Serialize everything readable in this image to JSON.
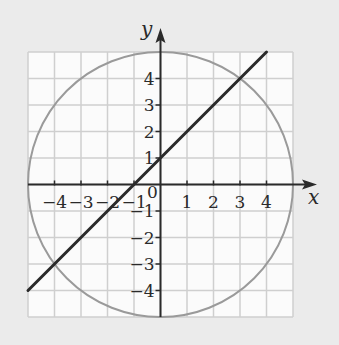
{
  "figure": {
    "background_color": "#ebebeb",
    "grid_background_color": "#fbfbfb",
    "grid_line_color": "#cfcfcf",
    "axis_color": "#2a2a2a",
    "circle_color": "#9a9a9a",
    "line_color": "#2a2a2a"
  },
  "axes": {
    "x_label": "x",
    "y_label": "y",
    "origin_label": "0",
    "grid_range": [
      -5,
      5
    ],
    "x_ticks": [
      {
        "value": -4,
        "label": "−4"
      },
      {
        "value": -3,
        "label": "−3"
      },
      {
        "value": -2,
        "label": "−2"
      },
      {
        "value": -1,
        "label": "−1"
      },
      {
        "value": 1,
        "label": "1"
      },
      {
        "value": 2,
        "label": "2"
      },
      {
        "value": 3,
        "label": "3"
      },
      {
        "value": 4,
        "label": "4"
      }
    ],
    "y_ticks": [
      {
        "value": 4,
        "label": "4"
      },
      {
        "value": 3,
        "label": "3"
      },
      {
        "value": 2,
        "label": "2"
      },
      {
        "value": 1,
        "label": "1"
      },
      {
        "value": -1,
        "label": "−1"
      },
      {
        "value": -2,
        "label": "−2"
      },
      {
        "value": -3,
        "label": "−3"
      },
      {
        "value": -4,
        "label": "−4"
      }
    ]
  },
  "curves": {
    "circle": {
      "center": [
        0,
        0
      ],
      "radius": 5
    },
    "line": {
      "equation": "y = x + 1",
      "from": [
        -5,
        -4
      ],
      "to": [
        4,
        5
      ]
    }
  },
  "intersections": [
    [
      -4,
      -3
    ],
    [
      3,
      4
    ]
  ]
}
